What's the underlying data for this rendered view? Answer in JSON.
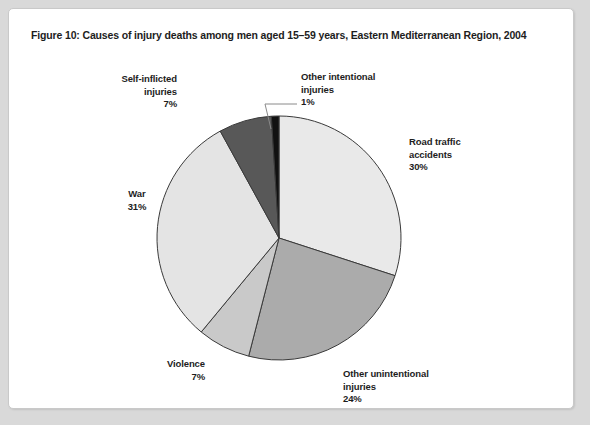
{
  "figure": {
    "title": "Figure 10: Causes of injury deaths among men aged 15–59 years, Eastern Mediterranean Region, 2004"
  },
  "labels": {
    "road_traffic": {
      "name_line1": "Road traffic",
      "name_line2": "accidents",
      "pct": "30%"
    },
    "other_unintentional": {
      "name_line1": "Other unintentional",
      "name_line2": "injuries",
      "pct": "24%"
    },
    "violence": {
      "name_line1": "Violence",
      "name_line2": "",
      "pct": "7%"
    },
    "war": {
      "name_line1": "War",
      "name_line2": "",
      "pct": "31%"
    },
    "self_inflicted": {
      "name_line1": "Self-inflicted",
      "name_line2": "injuries",
      "pct": "7%"
    },
    "other_intentional": {
      "name_line1": "Other intentional",
      "name_line2": "injuries",
      "pct": "1%"
    }
  },
  "chart_data": {
    "type": "pie",
    "title": "Figure 10: Causes of injury deaths among men aged 15–59 years, Eastern Mediterranean Region, 2004",
    "xlabel": "",
    "ylabel": "",
    "legend_position": "callout-labels",
    "grid": false,
    "start_angle_deg": 0,
    "direction": "clockwise",
    "categories": [
      "Road traffic accidents",
      "Other unintentional injuries",
      "Violence",
      "War",
      "Self-inflicted injuries",
      "Other intentional injuries"
    ],
    "values": [
      30,
      24,
      7,
      31,
      7,
      1
    ],
    "value_labels": [
      "30%",
      "24%",
      "7%",
      "31%",
      "7%",
      "1%"
    ],
    "units": "percent",
    "colors": [
      "#e9e9e9",
      "#ababab",
      "#c9c9c9",
      "#e4e4e4",
      "#585858",
      "#111111"
    ],
    "slice_stroke": "#3a3a3a",
    "center": {
      "x": 270,
      "y": 229
    },
    "radius": 122
  },
  "palette": {
    "card_background": "#ffffff",
    "page_background": "#d9d9d9",
    "card_border": "#c9c9c9",
    "text": "#1d1d1d",
    "leader_line": "#8a8a8a"
  }
}
